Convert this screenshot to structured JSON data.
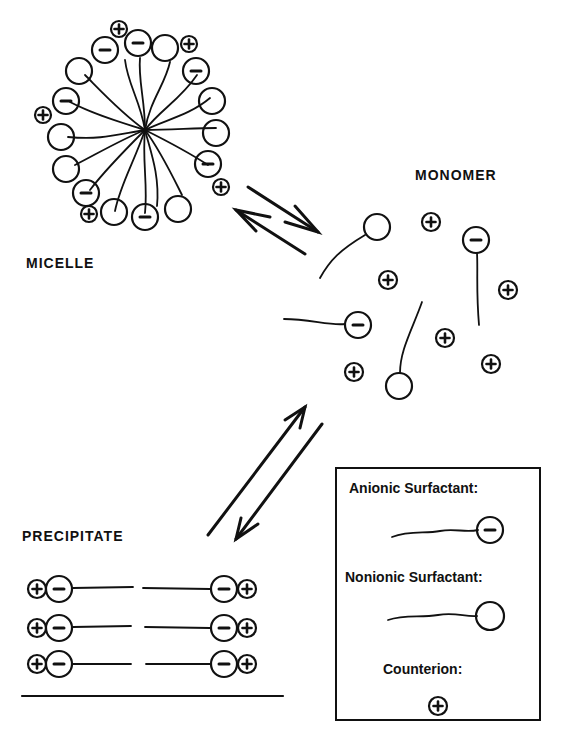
{
  "labels": {
    "micelle": "MICELLE",
    "monomer": "MONOMER",
    "precipitate": "PRECIPITATE"
  },
  "legend": {
    "anionic": "Anionic Surfactant:",
    "nonionic": "Nonionic Surfactant:",
    "counterion": "Counterion:"
  },
  "colors": {
    "ink": "#111111",
    "background": "#ffffff"
  },
  "icons": {
    "anionic_head": "circle-minus",
    "nonionic_head": "circle-empty",
    "counterion": "circle-plus"
  }
}
